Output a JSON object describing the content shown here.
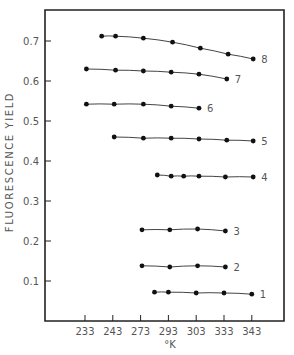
{
  "chart_data": {
    "type": "line",
    "title": "",
    "xlabel": "°K",
    "ylabel": "FLUORESCENCE YIELD",
    "x_tick_labels": [
      "233",
      "243",
      "273",
      "293",
      "303",
      "333",
      "343"
    ],
    "x_note": "x values are positions in tick-index units (0 = '233' tick, 6 = '343' tick); tick labels are shown as printed",
    "y_ticks": [
      0.1,
      0.2,
      0.3,
      0.4,
      0.5,
      0.6,
      0.7
    ],
    "y_tick_labels": [
      "0.1",
      "0.2",
      "0.3",
      "0.4",
      "0.5",
      "0.6",
      "0.7"
    ],
    "ylim": [
      0,
      0.77
    ],
    "xlim": [
      -1.45,
      7.2
    ],
    "grid": false,
    "legend": "inline labels at right end of each curve",
    "series": [
      {
        "name": "1",
        "x": [
          2.5,
          3.0,
          4.0,
          5.0,
          6.0
        ],
        "values": [
          0.072,
          0.072,
          0.07,
          0.07,
          0.067
        ]
      },
      {
        "name": "2",
        "x": [
          2.05,
          3.05,
          4.05,
          5.05
        ],
        "values": [
          0.138,
          0.135,
          0.138,
          0.135
        ]
      },
      {
        "name": "3",
        "x": [
          2.05,
          3.05,
          4.05,
          5.05
        ],
        "values": [
          0.228,
          0.228,
          0.23,
          0.225
        ]
      },
      {
        "name": "4",
        "x": [
          2.6,
          3.1,
          3.55,
          4.1,
          5.05,
          6.05
        ],
        "values": [
          0.365,
          0.362,
          0.362,
          0.362,
          0.36,
          0.36
        ]
      },
      {
        "name": "5",
        "x": [
          1.05,
          2.1,
          3.1,
          4.1,
          5.1,
          6.05
        ],
        "values": [
          0.46,
          0.457,
          0.457,
          0.455,
          0.452,
          0.45
        ]
      },
      {
        "name": "6",
        "x": [
          0.05,
          1.05,
          2.1,
          3.1,
          4.1
        ],
        "values": [
          0.542,
          0.542,
          0.542,
          0.537,
          0.532
        ]
      },
      {
        "name": "7",
        "x": [
          0.05,
          1.1,
          2.1,
          3.1,
          4.1,
          5.1
        ],
        "values": [
          0.63,
          0.627,
          0.625,
          0.622,
          0.617,
          0.605
        ]
      },
      {
        "name": "8",
        "x": [
          0.6,
          1.1,
          2.1,
          3.15,
          4.15,
          5.15,
          6.05
        ],
        "values": [
          0.712,
          0.712,
          0.707,
          0.697,
          0.682,
          0.667,
          0.655
        ]
      }
    ]
  },
  "colors": {
    "axis": "#222222",
    "line": "#444444",
    "marker": "#111111",
    "text": "#555555"
  }
}
